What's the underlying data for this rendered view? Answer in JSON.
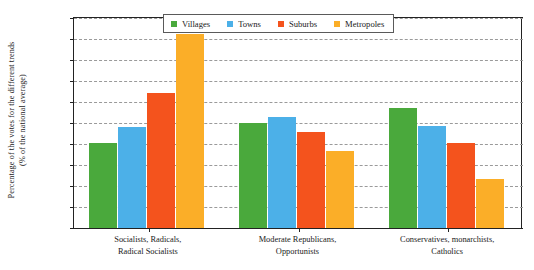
{
  "chart_data": {
    "type": "bar",
    "title": "",
    "xlabel": "",
    "ylabel": "Percentage of the votes for the different trends (% of the national average)",
    "ylabel_lines": [
      "Percentage of the votes for the different trends",
      "(% of the national average)"
    ],
    "ylim": [
      0,
      200
    ],
    "yunit": "%",
    "grid": true,
    "legend_position": "top-center",
    "categories": [
      "Socialists, Radicals, Radical Socialists",
      "Moderate Republicans, Opportunists",
      "Conservatives, monarchists, Catholics"
    ],
    "category_lines": [
      [
        "Socialists, Radicals,",
        "Radical Socialists"
      ],
      [
        "Moderate Republicans,",
        "Opportunists"
      ],
      [
        "Conservatives, monarchists,",
        "Catholics"
      ]
    ],
    "ytick_labels": [
      "0%",
      "20%",
      "40%",
      "60%",
      "80%",
      "100%",
      "120%",
      "140%",
      "160%",
      "180%",
      "200%"
    ],
    "yticks": [
      0,
      20,
      40,
      60,
      80,
      100,
      120,
      140,
      160,
      180,
      200
    ],
    "series": [
      {
        "name": "Villages",
        "color": "#4aa93c",
        "values": [
          81,
          100,
          114
        ]
      },
      {
        "name": "Towns",
        "color": "#4cb0e8",
        "values": [
          96,
          106,
          97
        ]
      },
      {
        "name": "Suburbs",
        "color": "#f4531d",
        "values": [
          129,
          91,
          81
        ]
      },
      {
        "name": "Metropoles",
        "color": "#fbae28",
        "values": [
          185,
          73,
          47
        ]
      }
    ]
  },
  "legend": {
    "items": [
      {
        "label": "Villages",
        "color": "#4aa93c"
      },
      {
        "label": "Towns",
        "color": "#4cb0e8"
      },
      {
        "label": "Suburbs",
        "color": "#f4531d"
      },
      {
        "label": "Metropoles",
        "color": "#fbae28"
      }
    ]
  },
  "colors": {
    "axis": "#222222",
    "grid": "#9a9a9a",
    "background": "#ffffff"
  }
}
